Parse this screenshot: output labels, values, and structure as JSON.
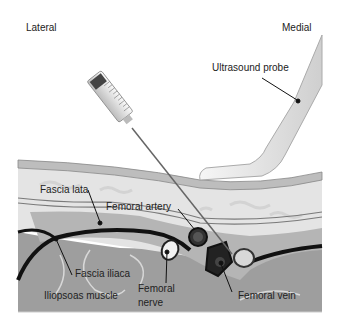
{
  "orientation": {
    "left": "Lateral",
    "right": "Medial"
  },
  "labels": {
    "ultrasound_probe": "Ultrasound probe",
    "fascia_lata": "Fascia lata",
    "femoral_artery": "Femoral artery",
    "fascia_iliaca": "Fascia iliaca",
    "iliopsoas_muscle": "Iliopsoas muscle",
    "femoral_nerve_line1": "Femoral",
    "femoral_nerve_line2": "nerve",
    "femoral_vein": "Femoral vein"
  },
  "syringe": {
    "markings": [
      "5",
      "4",
      "3",
      "2",
      "1"
    ]
  },
  "colors": {
    "skin": "#c8c8c8",
    "fat": "#e2e2e2",
    "fascia": "#8a8a8a",
    "muscle": "#9a9a9a",
    "dark": "#1a1a1a",
    "probe": "#e8e8e8"
  }
}
